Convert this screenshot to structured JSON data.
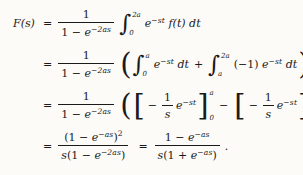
{
  "page": {
    "background": "#fcfbf8",
    "ink": "#1a1a1a"
  },
  "formula": {
    "line1": {
      "lhs": "F(s)",
      "equals": "=",
      "frac": {
        "num": "1",
        "den_pre": "1 − ",
        "den_base": "e",
        "den_exp": "−2as"
      },
      "integral": {
        "glyph": "∫",
        "upper": "2a",
        "lower": "0"
      },
      "integrand": {
        "base": "e",
        "exp": "−st",
        "tail": " f(t) dt"
      }
    },
    "line2": {
      "equals": "=",
      "frac": {
        "num": "1",
        "den_pre": "1 − ",
        "den_base": "e",
        "den_exp": "−2as"
      },
      "open_paren": "(",
      "int1": {
        "glyph": "∫",
        "upper": "a",
        "lower": "0",
        "base": "e",
        "exp": "−st",
        "tail": " dt"
      },
      "plus": "+",
      "int2": {
        "glyph": "∫",
        "upper": "2a",
        "lower": "a",
        "pre": "(−1) ",
        "base": "e",
        "exp": "−st",
        "tail": " dt"
      },
      "close_paren": ")"
    },
    "line3": {
      "equals": "=",
      "frac": {
        "num": "1",
        "den_pre": "1 − ",
        "den_base": "e",
        "den_exp": "−2as"
      },
      "open_paren": "(",
      "bracket1": {
        "open": "[",
        "minus": "−",
        "inner_num": "1",
        "inner_den": "s",
        "base": "e",
        "exp": "−st",
        "close": "]",
        "upper": "a",
        "lower": "0"
      },
      "minus": "−",
      "bracket2": {
        "open": "[",
        "minus": "−",
        "inner_num": "1",
        "inner_den": "s",
        "base": "e",
        "exp": "−st",
        "close": "]",
        "upper": "2a",
        "lower": "a"
      },
      "close_paren": ")"
    },
    "line4": {
      "equals": "=",
      "frac_left": {
        "num_pre": "(1 − ",
        "num_base": "e",
        "num_exp": "−as",
        "num_close": ")",
        "num_power": "2",
        "den_s": "s",
        "den_pre": "(1 − ",
        "den_base": "e",
        "den_exp": "−2as",
        "den_close": ")"
      },
      "equals2": "=",
      "frac_right": {
        "num_pre": "1 − ",
        "num_base": "e",
        "num_exp": "−as",
        "den_s": "s",
        "den_pre": "(1 + ",
        "den_base": "e",
        "den_exp": "−as",
        "den_close": ")"
      },
      "period": "."
    }
  }
}
